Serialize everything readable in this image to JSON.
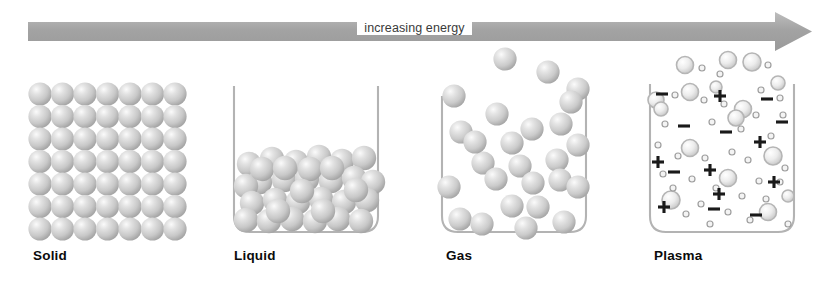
{
  "diagram": {
    "arrow": {
      "label": "increasing energy",
      "direction": "left-to-right",
      "color": "#a8a8a8"
    },
    "colors": {
      "sphere_fill": "#cfcfcf",
      "sphere_highlight": "#f2f2f2",
      "sphere_shadow": "#9d9d9d",
      "beaker_line": "#b0b0b0",
      "label_text": "#0b0b0b",
      "arrow_gray": "#a8a8a8",
      "ion_ring": "#b9b9b9",
      "charge_symbol": "#1a1a1a"
    },
    "panels": [
      {
        "id": "solid",
        "label": "Solid",
        "has_container": false,
        "arrangement": "regular close-packed lattice",
        "grid": {
          "columns": 7,
          "rows": 7
        },
        "particle_count": 49
      },
      {
        "id": "liquid",
        "label": "Liquid",
        "has_container": true,
        "arrangement": "dense irregular packing filling lower half of beaker",
        "particle_count": 40,
        "fill_level": "about half"
      },
      {
        "id": "gas",
        "label": "Gas",
        "has_container": true,
        "arrangement": "widely spaced, randomly distributed, some escaping above rim",
        "particle_count": 28,
        "escaped_particles": 3
      },
      {
        "id": "plasma",
        "label": "Plasma",
        "has_container": true,
        "arrangement": "ionized particles with free electrons and charge symbols",
        "ion_count": 22,
        "electron_count": 34,
        "plus_symbols": 8,
        "minus_symbols": 8,
        "escaped_particles": 5
      }
    ]
  }
}
